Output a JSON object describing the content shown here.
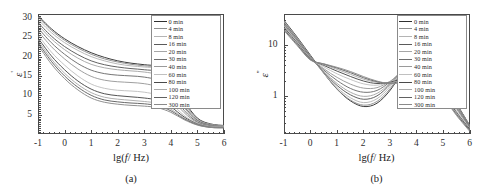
{
  "figure": {
    "top_text_fragment": "",
    "panels": [
      {
        "id": "panel-a",
        "subcaption": "(a)",
        "xlabel_prefix": "lg(",
        "xlabel_italic": "f",
        "xlabel_suffix": "/ Hz)",
        "ylabel": "ε",
        "ylabel_prime": "'",
        "xticks": [
          "-1",
          "0",
          "1",
          "2",
          "3",
          "4",
          "5",
          "6"
        ],
        "yticks": [
          "5",
          "10",
          "15",
          "20",
          "25",
          "30"
        ]
      },
      {
        "id": "panel-b",
        "subcaption": "(b)",
        "xlabel_prefix": "lg(",
        "xlabel_italic": "f",
        "xlabel_suffix": "/ Hz)",
        "ylabel": "ε",
        "ylabel_prime": "''",
        "xticks": [
          "-1",
          "0",
          "1",
          "2",
          "3",
          "4",
          "5",
          "6"
        ],
        "yticks": [
          "1",
          "10"
        ]
      }
    ]
  },
  "legend": {
    "items": [
      {
        "label": "0 min",
        "color": "#303030"
      },
      {
        "label": "4 min",
        "color": "#8f8f8f"
      },
      {
        "label": "8 min",
        "color": "#b4b4b4"
      },
      {
        "label": "16 min",
        "color": "#5a5a5a"
      },
      {
        "label": "20 min",
        "color": "#a6a6a6"
      },
      {
        "label": "30 min",
        "color": "#6e6e6e"
      },
      {
        "label": "40 min",
        "color": "#9a9a9a"
      },
      {
        "label": "60 min",
        "color": "#c0c0c0"
      },
      {
        "label": "80 min",
        "color": "#4a4a4a"
      },
      {
        "label": "100 min",
        "color": "#ababab"
      },
      {
        "label": "120 min",
        "color": "#616161"
      },
      {
        "label": "300 min",
        "color": "#8a8a8a"
      }
    ]
  },
  "chart_data": [
    {
      "type": "line",
      "title": "",
      "panel": "(a)",
      "xlabel": "lg(f/Hz)",
      "ylabel": "ε'",
      "xlim": [
        -1,
        6
      ],
      "ylim": [
        0,
        31
      ],
      "yscale": "linear",
      "xscale": "linear",
      "grid": false,
      "legend_position": "upper-right",
      "x": [
        -1,
        -0.5,
        0,
        0.5,
        1,
        1.5,
        2,
        2.5,
        3,
        3.5,
        4,
        4.5,
        5,
        5.5,
        6
      ],
      "series": [
        {
          "name": "0 min",
          "values": [
            30.6,
            27.2,
            24.6,
            22.6,
            21.0,
            19.8,
            18.9,
            18.3,
            17.9,
            17.4,
            15.2,
            8.6,
            4.1,
            2.6,
            2.2
          ]
        },
        {
          "name": "4 min",
          "values": [
            30.2,
            26.8,
            24.2,
            22.2,
            20.6,
            19.4,
            18.6,
            18.0,
            17.6,
            17.1,
            14.6,
            8.2,
            3.9,
            2.5,
            2.1
          ]
        },
        {
          "name": "8 min",
          "values": [
            29.6,
            26.2,
            23.6,
            21.6,
            20.0,
            18.9,
            18.1,
            17.6,
            17.3,
            16.8,
            14.0,
            7.8,
            3.7,
            2.4,
            2.1
          ]
        },
        {
          "name": "16 min",
          "values": [
            28.8,
            25.3,
            22.6,
            20.5,
            18.9,
            17.9,
            17.3,
            16.9,
            16.6,
            16.0,
            13.0,
            7.2,
            3.5,
            2.3,
            2.0
          ]
        },
        {
          "name": "20 min",
          "values": [
            28.2,
            24.6,
            21.8,
            19.6,
            18.0,
            17.1,
            16.6,
            16.3,
            16.0,
            15.2,
            12.2,
            6.8,
            3.3,
            2.2,
            2.0
          ]
        },
        {
          "name": "30 min",
          "values": [
            27.4,
            23.6,
            20.6,
            18.2,
            16.5,
            15.6,
            15.2,
            15.0,
            14.7,
            13.8,
            10.8,
            6.1,
            3.1,
            2.1,
            1.9
          ]
        },
        {
          "name": "40 min",
          "values": [
            26.6,
            22.6,
            19.4,
            16.8,
            14.9,
            13.9,
            13.5,
            13.3,
            13.0,
            12.1,
            9.4,
            5.5,
            2.9,
            2.0,
            1.8
          ]
        },
        {
          "name": "60 min",
          "values": [
            25.6,
            21.2,
            17.8,
            15.0,
            12.9,
            11.8,
            11.3,
            11.1,
            10.8,
            10.0,
            7.9,
            4.8,
            2.7,
            1.9,
            1.8
          ]
        },
        {
          "name": "80 min",
          "values": [
            24.8,
            20.2,
            16.6,
            13.7,
            11.6,
            10.4,
            9.9,
            9.6,
            9.3,
            8.7,
            7.0,
            4.4,
            2.6,
            1.8,
            1.7
          ]
        },
        {
          "name": "100 min",
          "values": [
            24.2,
            19.4,
            15.7,
            12.8,
            10.7,
            9.5,
            9.0,
            8.7,
            8.4,
            7.9,
            6.4,
            4.1,
            2.5,
            1.8,
            1.7
          ]
        },
        {
          "name": "120 min",
          "values": [
            23.6,
            18.8,
            15.0,
            12.1,
            10.0,
            8.8,
            8.3,
            8.0,
            7.8,
            7.3,
            6.0,
            3.9,
            2.4,
            1.7,
            1.6
          ]
        },
        {
          "name": "300 min",
          "values": [
            23.0,
            18.1,
            14.3,
            11.4,
            9.3,
            8.2,
            7.7,
            7.4,
            7.2,
            6.8,
            5.6,
            3.7,
            2.3,
            1.7,
            1.6
          ]
        }
      ]
    },
    {
      "type": "line",
      "title": "",
      "panel": "(b)",
      "xlabel": "lg(f/Hz)",
      "ylabel": "ε''",
      "xlim": [
        -1,
        6
      ],
      "ylim": [
        0.18,
        40
      ],
      "yscale": "log",
      "xscale": "linear",
      "grid": false,
      "legend_position": "upper-right",
      "x": [
        -1,
        -0.5,
        0,
        0.5,
        1,
        1.5,
        2,
        2.5,
        3,
        3.5,
        4,
        4.5,
        5,
        5.5,
        6
      ],
      "series": [
        {
          "name": "0 min",
          "values": [
            30.0,
            14.0,
            6.2,
            2.8,
            1.35,
            0.8,
            0.62,
            0.72,
            1.3,
            3.2,
            6.4,
            5.1,
            1.9,
            0.7,
            0.26
          ]
        },
        {
          "name": "4 min",
          "values": [
            29.0,
            13.6,
            6.0,
            2.75,
            1.36,
            0.83,
            0.66,
            0.78,
            1.4,
            3.3,
            6.3,
            4.95,
            1.85,
            0.68,
            0.26
          ]
        },
        {
          "name": "8 min",
          "values": [
            28.0,
            13.2,
            5.9,
            2.8,
            1.45,
            0.92,
            0.74,
            0.88,
            1.55,
            3.4,
            6.0,
            4.7,
            1.8,
            0.66,
            0.25
          ]
        },
        {
          "name": "16 min",
          "values": [
            27.0,
            12.8,
            5.8,
            2.9,
            1.6,
            1.05,
            0.86,
            1.0,
            1.7,
            3.45,
            5.6,
            4.4,
            1.72,
            0.64,
            0.25
          ]
        },
        {
          "name": "20 min",
          "values": [
            26.0,
            12.4,
            5.7,
            3.0,
            1.75,
            1.18,
            0.98,
            1.12,
            1.8,
            3.4,
            5.2,
            4.1,
            1.65,
            0.62,
            0.24
          ]
        },
        {
          "name": "30 min",
          "values": [
            25.0,
            12.0,
            5.6,
            3.2,
            2.0,
            1.4,
            1.18,
            1.28,
            1.9,
            3.2,
            4.4,
            3.5,
            1.5,
            0.58,
            0.24
          ]
        },
        {
          "name": "40 min",
          "values": [
            24.0,
            11.6,
            5.5,
            3.4,
            2.3,
            1.7,
            1.42,
            1.45,
            1.95,
            2.9,
            3.7,
            3.0,
            1.38,
            0.55,
            0.23
          ]
        },
        {
          "name": "60 min",
          "values": [
            23.0,
            11.2,
            5.4,
            3.7,
            2.7,
            2.1,
            1.72,
            1.62,
            1.9,
            2.5,
            3.0,
            2.5,
            1.22,
            0.5,
            0.22
          ]
        },
        {
          "name": "80 min",
          "values": [
            22.0,
            10.8,
            5.3,
            3.95,
            3.05,
            2.4,
            1.95,
            1.75,
            1.85,
            2.25,
            2.6,
            2.2,
            1.12,
            0.47,
            0.22
          ]
        },
        {
          "name": "100 min",
          "values": [
            21.0,
            10.4,
            5.2,
            4.1,
            3.3,
            2.65,
            2.12,
            1.84,
            1.8,
            2.05,
            2.35,
            2.0,
            1.04,
            0.45,
            0.21
          ]
        },
        {
          "name": "120 min",
          "values": [
            20.0,
            10.0,
            5.1,
            4.2,
            3.5,
            2.85,
            2.26,
            1.9,
            1.76,
            1.92,
            2.15,
            1.85,
            0.98,
            0.43,
            0.21
          ]
        },
        {
          "name": "300 min",
          "values": [
            19.0,
            9.6,
            5.0,
            4.25,
            3.62,
            3.0,
            2.38,
            1.95,
            1.74,
            1.84,
            2.02,
            1.74,
            0.93,
            0.41,
            0.2
          ]
        }
      ]
    }
  ]
}
